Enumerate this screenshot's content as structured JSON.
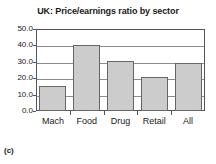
{
  "figure": {
    "label": "(c)",
    "background_color": "#ffffff"
  },
  "chart_data": {
    "type": "bar",
    "title": "UK: Price/earnings ratio by sector",
    "xlabel": "",
    "ylabel": "",
    "categories": [
      "Mach",
      "Food",
      "Drug",
      "Retail",
      "All"
    ],
    "values": [
      15.2,
      40.5,
      30.3,
      20.6,
      29.0
    ],
    "ylim": [
      0.0,
      50.0
    ],
    "ytick_values": [
      0.0,
      10.0,
      20.0,
      30.0,
      40.0,
      50.0
    ],
    "ytick_labels": [
      "0.0",
      "10.0",
      "20.0",
      "30.0",
      "40.0",
      "50.0"
    ],
    "grid": true,
    "grid_axis": "y",
    "legend": false,
    "legend_position": "none",
    "bar_fill_color": "#cccccc",
    "bar_edge_color": "#666666",
    "axis_color": "#555555",
    "gridline_color": "#8c8c8c",
    "text_color": "#1a1a1a"
  }
}
